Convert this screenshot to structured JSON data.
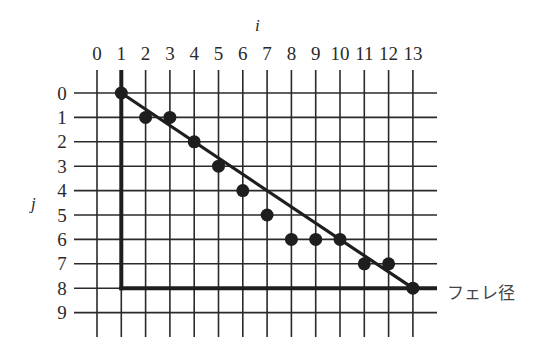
{
  "diagram": {
    "axis_i_label": "i",
    "axis_j_label": "j",
    "feret_label": "フェレ径",
    "column_labels": [
      "0",
      "1",
      "2",
      "3",
      "4",
      "5",
      "6",
      "7",
      "8",
      "9",
      "10",
      "11",
      "12",
      "13"
    ],
    "row_labels": [
      "0",
      "1",
      "2",
      "3",
      "4",
      "5",
      "6",
      "7",
      "8",
      "9"
    ],
    "points": [
      {
        "i": 1,
        "j": 0
      },
      {
        "i": 2,
        "j": 1
      },
      {
        "i": 3,
        "j": 1
      },
      {
        "i": 4,
        "j": 2
      },
      {
        "i": 5,
        "j": 3
      },
      {
        "i": 6,
        "j": 4
      },
      {
        "i": 7,
        "j": 5
      },
      {
        "i": 8,
        "j": 6
      },
      {
        "i": 9,
        "j": 6
      },
      {
        "i": 10,
        "j": 6
      },
      {
        "i": 11,
        "j": 7
      },
      {
        "i": 12,
        "j": 7
      },
      {
        "i": 13,
        "j": 8
      }
    ],
    "diagonal_line": {
      "from": {
        "i": 1,
        "j": 0
      },
      "to": {
        "i": 13,
        "j": 8
      }
    },
    "feret_box": {
      "vertical_at_i": 1,
      "horizontal_at_j": 8,
      "from_j": 0,
      "to_i": 13
    },
    "colors": {
      "grid": "#2a2a2a",
      "points": "#1e1e1e",
      "text": "#2a2a2a",
      "background": "#ffffff"
    }
  }
}
